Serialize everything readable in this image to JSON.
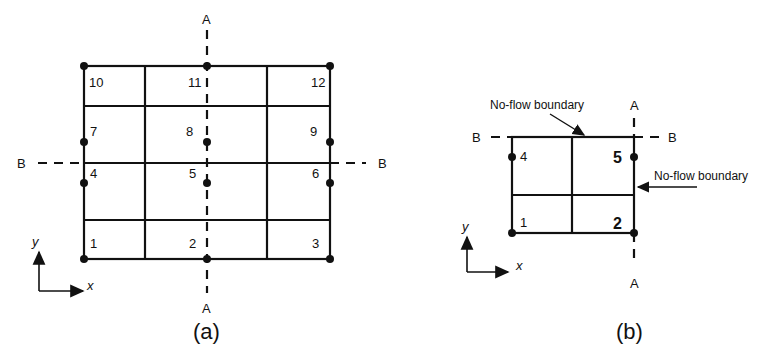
{
  "figure_a": {
    "caption": "(a)",
    "section_top": "A",
    "section_bottom": "A",
    "section_left": "B",
    "section_right": "B",
    "cells": [
      "1",
      "2",
      "3",
      "4",
      "5",
      "6",
      "7",
      "8",
      "9",
      "10",
      "11",
      "12"
    ],
    "axis_x": "x",
    "axis_y": "y"
  },
  "figure_b": {
    "caption": "(b)",
    "section_top": "A",
    "section_bottom": "A",
    "section_left": "B",
    "section_right": "B",
    "cells": [
      "1",
      "2",
      "4",
      "5"
    ],
    "noflow_top": "No-flow boundary",
    "noflow_right": "No-flow boundary",
    "axis_x": "x",
    "axis_y": "y"
  }
}
